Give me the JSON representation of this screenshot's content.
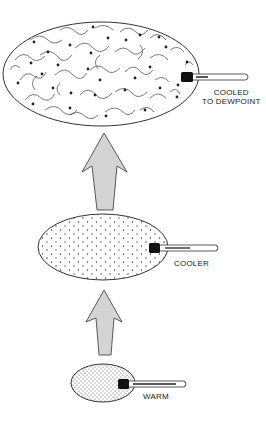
{
  "diagram": {
    "stages": [
      {
        "id": "cooled",
        "label_line1": "COOLED",
        "label_line2": "TO DEWPOINT",
        "fill": "condensation"
      },
      {
        "id": "cooler",
        "label": "COOLER",
        "fill": "sparse-stipple"
      },
      {
        "id": "warm",
        "label": "WARM",
        "fill": "dense-stipple"
      }
    ],
    "arrows": [
      {
        "from": "warm",
        "to": "cooler",
        "direction": "up"
      },
      {
        "from": "cooler",
        "to": "cooled",
        "direction": "up"
      }
    ],
    "colors": {
      "outline": "#333333",
      "arrow_fill": "#d4d4d4",
      "thermometer_bulb": "#111111",
      "background": "#ffffff"
    }
  }
}
